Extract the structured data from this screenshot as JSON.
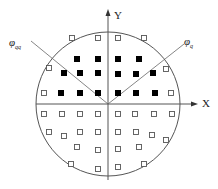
{
  "diagram": {
    "type": "constellation-scatter",
    "colors": {
      "line": "#555555",
      "filled_square": "#000000",
      "hollow_square_stroke": "#555555",
      "background": "#ffffff"
    },
    "axes": {
      "x_label": "X",
      "y_label": "Y"
    },
    "angle_labels": {
      "phi_qq": {
        "symbol": "φ",
        "sub": "qq"
      },
      "phi_q": {
        "symbol": "φ",
        "sub": "q"
      }
    },
    "circle": {
      "cx": 108,
      "cy": 104,
      "r": 72
    },
    "filled_squares": [
      [
        77,
        59
      ],
      [
        98,
        59
      ],
      [
        64,
        73
      ],
      [
        80,
        73
      ],
      [
        98,
        73
      ],
      [
        61,
        93
      ],
      [
        80,
        93
      ],
      [
        98,
        93
      ],
      [
        118,
        59
      ],
      [
        139,
        59
      ],
      [
        118,
        74
      ],
      [
        136,
        74
      ],
      [
        153,
        73
      ],
      [
        118,
        93
      ],
      [
        136,
        93
      ],
      [
        155,
        93
      ]
    ],
    "hollow_squares": [
      [
        72,
        38
      ],
      [
        98,
        38
      ],
      [
        49,
        68
      ],
      [
        44,
        93
      ],
      [
        118,
        38
      ],
      [
        144,
        38
      ],
      [
        166,
        69
      ],
      [
        171,
        93
      ],
      [
        44,
        114
      ],
      [
        62,
        114
      ],
      [
        80,
        114
      ],
      [
        98,
        114
      ],
      [
        49,
        132
      ],
      [
        64,
        136
      ],
      [
        80,
        132
      ],
      [
        98,
        132
      ],
      [
        77,
        147
      ],
      [
        98,
        150
      ],
      [
        71,
        164
      ],
      [
        98,
        169
      ],
      [
        118,
        114
      ],
      [
        135,
        114
      ],
      [
        154,
        114
      ],
      [
        172,
        114
      ],
      [
        118,
        132
      ],
      [
        136,
        132
      ],
      [
        152,
        135
      ],
      [
        166,
        140
      ],
      [
        118,
        149
      ],
      [
        139,
        147
      ],
      [
        118,
        167
      ],
      [
        144,
        164
      ]
    ]
  }
}
